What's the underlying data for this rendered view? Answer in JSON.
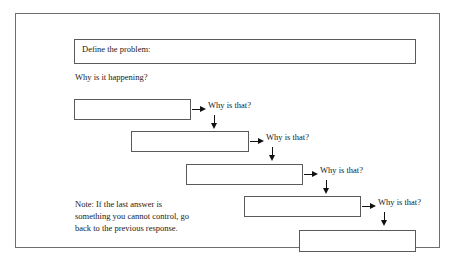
{
  "worksheet": {
    "problem_prompt": "Define the problem:",
    "why_prompt": "Why is it happening?",
    "note": "Note: If the last answer is something you cannot control, go back to the previous response.",
    "why_label": "Why is that?",
    "colors": {
      "page_background": "#ffffff",
      "frame_border": "#6e6e6e",
      "box_border": "#5a5a5a",
      "arrow": "#111111",
      "text": "#1a1a1a"
    },
    "answer_boxes": [
      {
        "index": 1,
        "value": ""
      },
      {
        "index": 2,
        "value": ""
      },
      {
        "index": 3,
        "value": ""
      },
      {
        "index": 4,
        "value": ""
      },
      {
        "index": 5,
        "value": ""
      }
    ],
    "why_labels": [
      {
        "index": 1,
        "label": "Why is that?"
      },
      {
        "index": 2,
        "label": "Why is that?"
      },
      {
        "index": 3,
        "label": "Why is that?"
      },
      {
        "index": 4,
        "label": "Why is that?"
      }
    ]
  }
}
